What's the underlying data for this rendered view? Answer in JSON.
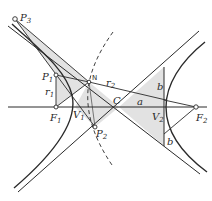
{
  "figure": {
    "colors": {
      "line": "#2a2a2a",
      "fill": "#e2e2e2",
      "background": "#ffffff",
      "point_fill": "#ffffff"
    },
    "points": [
      {
        "id": "P3",
        "label": "P",
        "sub": "3",
        "x": 15,
        "y": 19
      },
      {
        "id": "P1",
        "label": "P",
        "sub": "1",
        "x": 56,
        "y": 75
      },
      {
        "id": "N",
        "label": "N",
        "sub": "",
        "x": 89,
        "y": 82
      },
      {
        "id": "F1",
        "label": "F",
        "sub": "1",
        "x": 56,
        "y": 107
      },
      {
        "id": "P2",
        "label": "P",
        "sub": "2",
        "x": 95,
        "y": 127
      },
      {
        "id": "F2",
        "label": "F",
        "sub": "2",
        "x": 196,
        "y": 107
      }
    ],
    "labels": {
      "P3": "P",
      "P3_sub": "3",
      "P1": "P",
      "P1_sub": "1",
      "N": "N",
      "r1": "r",
      "r1_sub": "1",
      "r2": "r",
      "r2_sub": "2",
      "F1": "F",
      "F1_sub": "1",
      "V1": "V",
      "V1_sub": "1",
      "P2": "P",
      "P2_sub": "2",
      "C": "C",
      "a": "a",
      "V2": "V",
      "V2_sub": "2",
      "F2": "F",
      "F2_sub": "2",
      "b_top": "b",
      "b_bottom": "b"
    }
  }
}
